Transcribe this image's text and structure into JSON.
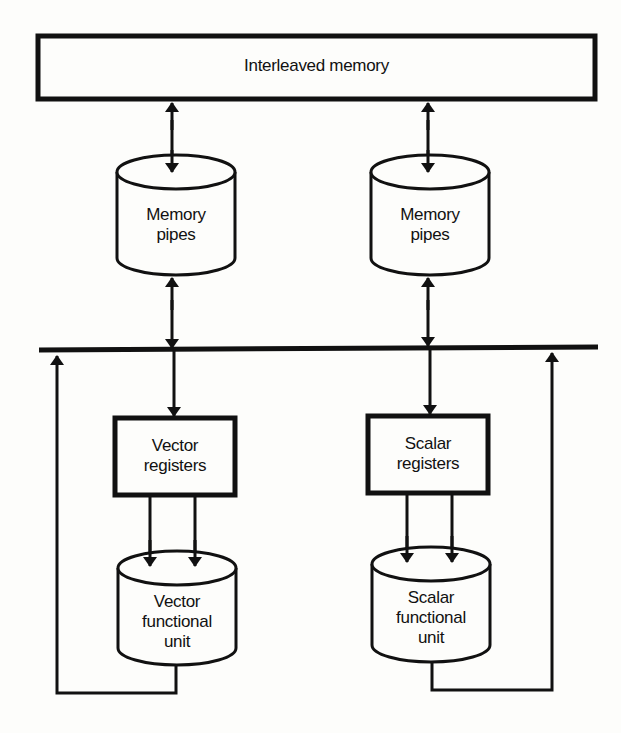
{
  "diagram": {
    "memory": {
      "label": "Interleaved memory"
    },
    "left_column": {
      "memory_pipes": {
        "line1": "Memory",
        "line2": "pipes"
      },
      "registers": {
        "line1": "Vector",
        "line2": "registers"
      },
      "functional_unit": {
        "line1": "Vector",
        "line2": "functional",
        "line3": "unit"
      }
    },
    "right_column": {
      "memory_pipes": {
        "line1": "Memory",
        "line2": "pipes"
      },
      "registers": {
        "line1": "Scalar",
        "line2": "registers"
      },
      "functional_unit": {
        "line1": "Scalar",
        "line2": "functional",
        "line3": "unit"
      }
    },
    "colors": {
      "stroke": "#111111",
      "background": "#fdfdfb"
    }
  }
}
